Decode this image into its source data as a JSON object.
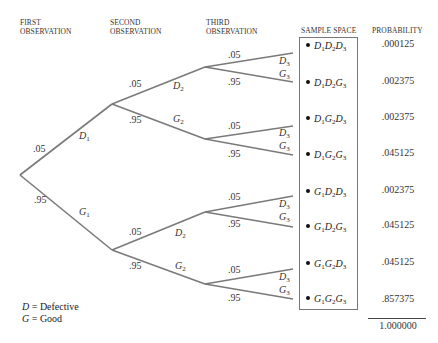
{
  "headers": {
    "first": [
      "FIRST",
      "OBSERVATION"
    ],
    "second": [
      "SECOND",
      "OBSERVATION"
    ],
    "third": [
      "THIRD",
      "OBSERVATION"
    ],
    "sample_space": "SAMPLE SPACE",
    "probability": "PROBABILITY"
  },
  "tree": {
    "level1": [
      {
        "event": "D",
        "sub": "1",
        "prob": ".05"
      },
      {
        "event": "G",
        "sub": "1",
        "prob": ".95"
      }
    ],
    "level2": [
      {
        "event": "D",
        "sub": "2",
        "prob": ".05"
      },
      {
        "event": "G",
        "sub": "2",
        "prob": ".95"
      },
      {
        "event": "D",
        "sub": "2",
        "prob": ".05"
      },
      {
        "event": "G",
        "sub": "2",
        "prob": ".95"
      }
    ],
    "level3": [
      {
        "event": "D",
        "sub": "3",
        "prob": ".05"
      },
      {
        "event": "G",
        "sub": "3",
        "prob": ".95"
      },
      {
        "event": "D",
        "sub": "3",
        "prob": ".05"
      },
      {
        "event": "G",
        "sub": "3",
        "prob": ".95"
      },
      {
        "event": "D",
        "sub": "3",
        "prob": ".05"
      },
      {
        "event": "G",
        "sub": "3",
        "prob": ".95"
      },
      {
        "event": "D",
        "sub": "3",
        "prob": ".05"
      },
      {
        "event": "G",
        "sub": "3",
        "prob": ".95"
      }
    ]
  },
  "outcomes": [
    {
      "a": "D",
      "b": "D",
      "c": "D",
      "s1": "1",
      "s2": "2",
      "s3": "3",
      "probability": ".000125"
    },
    {
      "a": "D",
      "b": "D",
      "c": "G",
      "s1": "1",
      "s2": "2",
      "s3": "3",
      "probability": ".002375"
    },
    {
      "a": "D",
      "b": "G",
      "c": "D",
      "s1": "1",
      "s2": "2",
      "s3": "3",
      "probability": ".002375"
    },
    {
      "a": "D",
      "b": "G",
      "c": "G",
      "s1": "1",
      "s2": "2",
      "s3": "3",
      "probability": ".045125"
    },
    {
      "a": "G",
      "b": "D",
      "c": "D",
      "s1": "1",
      "s2": "2",
      "s3": "3",
      "probability": ".002375"
    },
    {
      "a": "G",
      "b": "D",
      "c": "G",
      "s1": "1",
      "s2": "2",
      "s3": "3",
      "probability": ".045125"
    },
    {
      "a": "G",
      "b": "G",
      "c": "D",
      "s1": "1",
      "s2": "2",
      "s3": "3",
      "probability": ".045125"
    },
    {
      "a": "G",
      "b": "G",
      "c": "G",
      "s1": "1",
      "s2": "2",
      "s3": "3",
      "probability": ".857375"
    }
  ],
  "total": "1.000000",
  "legend": [
    {
      "symbol": "D",
      "eq": " = ",
      "meaning": "Defective"
    },
    {
      "symbol": "G",
      "eq": " = ",
      "meaning": "Good"
    }
  ],
  "colors": {
    "line": "#7a7a7a",
    "text": "#222222"
  }
}
